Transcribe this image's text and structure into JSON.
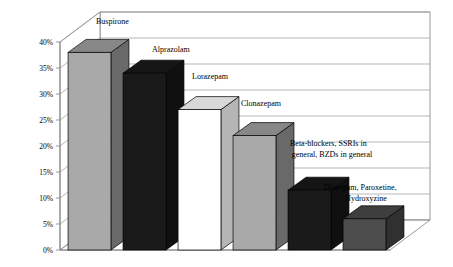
{
  "chart_data": {
    "type": "bar",
    "title": "",
    "subtitle": "",
    "xlabel": "",
    "ylabel": "",
    "ylim": [
      0,
      40
    ],
    "yunit": "%",
    "grid": true,
    "legend": "none",
    "style": "3d-column",
    "categories": [
      "Buspirone",
      "Alprazolam",
      "Lorazepam",
      "Clonazepam",
      "Beta-blockers, SSRIs in general, BZDs in general",
      "Diazepam, Paroxetine, Hydroxyzine"
    ],
    "values": [
      38,
      34,
      27,
      22,
      11.5,
      6
    ],
    "bar_colors": [
      "#a9a9a9",
      "#1a1a1a",
      "#ffffff",
      "#a9a9a9",
      "#1a1a1a",
      "#4d4d4d"
    ],
    "ticks": [
      "0%",
      "5%",
      "10%",
      "15%",
      "20%",
      "25%",
      "30%",
      "35%",
      "40%"
    ],
    "tick_values": [
      0,
      5,
      10,
      15,
      20,
      25,
      30,
      35,
      40
    ],
    "annotations": [
      {
        "text": "Buspirone",
        "lines": [
          "Buspirone"
        ]
      },
      {
        "text": "Alprazolam",
        "lines": [
          "Alprazolam"
        ]
      },
      {
        "text": "Lorazepam",
        "lines": [
          "Lorazepam"
        ]
      },
      {
        "text": "Clonazepam",
        "lines": [
          "Clonazepam"
        ]
      },
      {
        "text": "Beta-blockers, SSRIs in general, BZDs in general",
        "lines": [
          "Beta-blockers, SSRIs in",
          "general, BZDs in general"
        ]
      },
      {
        "text": "Diazepam, Paroxetine, Hydroxyzine",
        "lines": [
          "Diazepam, Paroxetine,",
          "Hydroxyzine"
        ]
      }
    ],
    "colors": {
      "axis": "#808080",
      "grid": "#9a9a9a",
      "floor": "#ffffff",
      "wall": "#ffffff"
    }
  }
}
